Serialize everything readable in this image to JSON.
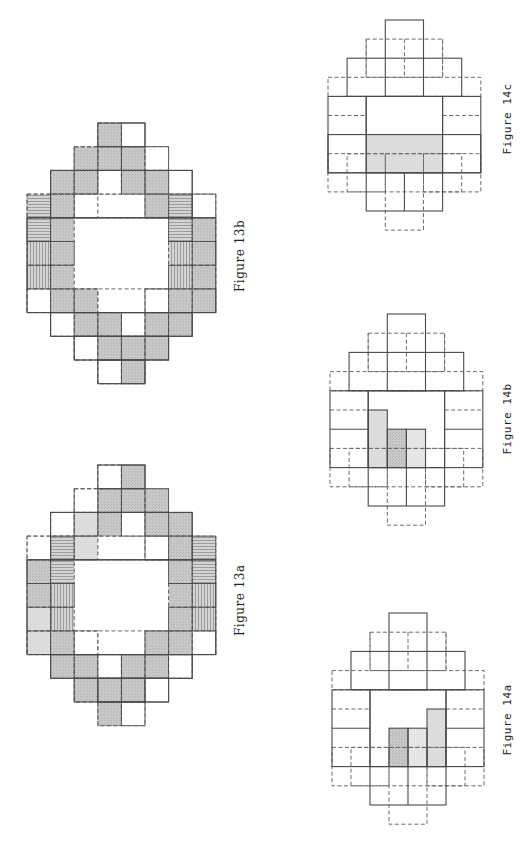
{
  "colors": {
    "line": "#4a4a4a",
    "dashed": "#6a6a6a",
    "shade": "#c9c9c9",
    "shade_dark": "#bdbdbd",
    "shade_light": "#dcdcdc",
    "hatch": "#9a9a9a"
  },
  "figures": [
    {
      "id": "fig-13b",
      "label": "Figure 13b",
      "grid": {
        "cols": 8,
        "rows": 11
      },
      "cells": [
        {
          "r": 0,
          "c": 3,
          "fill": "shade"
        },
        {
          "r": 0,
          "c": 4,
          "fill": "white"
        },
        {
          "r": 1,
          "c": 2,
          "fill": "shade"
        },
        {
          "r": 1,
          "c": 3,
          "fill": "shade"
        },
        {
          "r": 1,
          "c": 4,
          "fill": "shade"
        },
        {
          "r": 1,
          "c": 5,
          "fill": "white"
        },
        {
          "r": 2,
          "c": 1,
          "fill": "shade"
        },
        {
          "r": 2,
          "c": 2,
          "fill": "shade"
        },
        {
          "r": 2,
          "c": 3,
          "fill": "white"
        },
        {
          "r": 2,
          "c": 4,
          "fill": "shade"
        },
        {
          "r": 2,
          "c": 5,
          "fill": "shade"
        },
        {
          "r": 2,
          "c": 6,
          "fill": "white"
        },
        {
          "r": 3,
          "c": 0,
          "fill": "hlines"
        },
        {
          "r": 3,
          "c": 1,
          "fill": "shade"
        },
        {
          "r": 3,
          "c": 2,
          "fill": "white"
        },
        {
          "r": 3,
          "c": 5,
          "fill": "shade"
        },
        {
          "r": 3,
          "c": 6,
          "fill": "hlines"
        },
        {
          "r": 3,
          "c": 7,
          "fill": "white"
        },
        {
          "r": 4,
          "c": 0,
          "fill": "hlines"
        },
        {
          "r": 4,
          "c": 1,
          "fill": "shade"
        },
        {
          "r": 4,
          "c": 6,
          "fill": "hlines"
        },
        {
          "r": 4,
          "c": 7,
          "fill": "shade"
        },
        {
          "r": 5,
          "c": 0,
          "fill": "vlines"
        },
        {
          "r": 5,
          "c": 1,
          "fill": "shade"
        },
        {
          "r": 5,
          "c": 6,
          "fill": "vlines"
        },
        {
          "r": 5,
          "c": 7,
          "fill": "shade"
        },
        {
          "r": 6,
          "c": 0,
          "fill": "vlines"
        },
        {
          "r": 6,
          "c": 1,
          "fill": "shade"
        },
        {
          "r": 6,
          "c": 6,
          "fill": "vlines"
        },
        {
          "r": 6,
          "c": 7,
          "fill": "shade"
        },
        {
          "r": 7,
          "c": 0,
          "fill": "white"
        },
        {
          "r": 7,
          "c": 1,
          "fill": "shade"
        },
        {
          "r": 7,
          "c": 2,
          "fill": "shade"
        },
        {
          "r": 7,
          "c": 5,
          "fill": "white"
        },
        {
          "r": 7,
          "c": 6,
          "fill": "shade"
        },
        {
          "r": 7,
          "c": 7,
          "fill": "shade"
        },
        {
          "r": 8,
          "c": 1,
          "fill": "white"
        },
        {
          "r": 8,
          "c": 2,
          "fill": "shade"
        },
        {
          "r": 8,
          "c": 3,
          "fill": "shade"
        },
        {
          "r": 8,
          "c": 4,
          "fill": "white"
        },
        {
          "r": 8,
          "c": 5,
          "fill": "shade"
        },
        {
          "r": 8,
          "c": 6,
          "fill": "shade"
        },
        {
          "r": 9,
          "c": 2,
          "fill": "white"
        },
        {
          "r": 9,
          "c": 3,
          "fill": "shade"
        },
        {
          "r": 9,
          "c": 4,
          "fill": "shade"
        },
        {
          "r": 9,
          "c": 5,
          "fill": "shade"
        },
        {
          "r": 10,
          "c": 3,
          "fill": "white"
        },
        {
          "r": 10,
          "c": 4,
          "fill": "shade"
        }
      ],
      "solid_rects": [
        [
          3,
          0,
          2,
          1
        ],
        [
          1,
          2,
          6,
          2
        ],
        [
          0,
          4,
          8,
          4
        ],
        [
          1,
          8,
          6,
          1
        ],
        [
          3,
          10,
          2,
          1
        ],
        [
          2,
          9,
          4,
          1
        ]
      ],
      "dashed_rects": [
        [
          2,
          1,
          4,
          1
        ],
        [
          0,
          3,
          8,
          1
        ],
        [
          0,
          7,
          8,
          1
        ],
        [
          1,
          8,
          6,
          1
        ],
        [
          2,
          1,
          1,
          2
        ],
        [
          5,
          2,
          1,
          2
        ],
        [
          2,
          7,
          1,
          1
        ],
        [
          5,
          7,
          1,
          1
        ],
        [
          3,
          10,
          2,
          1
        ],
        [
          2,
          9,
          4,
          1
        ]
      ]
    },
    {
      "id": "fig-13a",
      "label": "Figure 13a",
      "grid": {
        "cols": 8,
        "rows": 11
      },
      "cells": [
        {
          "r": 0,
          "c": 3,
          "fill": "white"
        },
        {
          "r": 0,
          "c": 4,
          "fill": "shade"
        },
        {
          "r": 1,
          "c": 2,
          "fill": "white"
        },
        {
          "r": 1,
          "c": 3,
          "fill": "shade"
        },
        {
          "r": 1,
          "c": 4,
          "fill": "shade"
        },
        {
          "r": 1,
          "c": 5,
          "fill": "shade"
        },
        {
          "r": 2,
          "c": 1,
          "fill": "white"
        },
        {
          "r": 2,
          "c": 2,
          "fill": "light"
        },
        {
          "r": 2,
          "c": 3,
          "fill": "shade"
        },
        {
          "r": 2,
          "c": 4,
          "fill": "white"
        },
        {
          "r": 2,
          "c": 5,
          "fill": "shade"
        },
        {
          "r": 2,
          "c": 6,
          "fill": "shade"
        },
        {
          "r": 3,
          "c": 0,
          "fill": "white"
        },
        {
          "r": 3,
          "c": 1,
          "fill": "hlines"
        },
        {
          "r": 3,
          "c": 2,
          "fill": "light"
        },
        {
          "r": 3,
          "c": 5,
          "fill": "white"
        },
        {
          "r": 3,
          "c": 6,
          "fill": "shade"
        },
        {
          "r": 3,
          "c": 7,
          "fill": "hlines"
        },
        {
          "r": 4,
          "c": 0,
          "fill": "shade"
        },
        {
          "r": 4,
          "c": 1,
          "fill": "hlines"
        },
        {
          "r": 4,
          "c": 6,
          "fill": "shade"
        },
        {
          "r": 4,
          "c": 7,
          "fill": "hlines"
        },
        {
          "r": 5,
          "c": 0,
          "fill": "shade"
        },
        {
          "r": 5,
          "c": 1,
          "fill": "vlines"
        },
        {
          "r": 5,
          "c": 6,
          "fill": "shade"
        },
        {
          "r": 5,
          "c": 7,
          "fill": "vlines"
        },
        {
          "r": 6,
          "c": 0,
          "fill": "light"
        },
        {
          "r": 6,
          "c": 1,
          "fill": "vlines"
        },
        {
          "r": 6,
          "c": 6,
          "fill": "shade"
        },
        {
          "r": 6,
          "c": 7,
          "fill": "vlines"
        },
        {
          "r": 7,
          "c": 0,
          "fill": "light"
        },
        {
          "r": 7,
          "c": 1,
          "fill": "shade"
        },
        {
          "r": 7,
          "c": 2,
          "fill": "white"
        },
        {
          "r": 7,
          "c": 5,
          "fill": "shade"
        },
        {
          "r": 7,
          "c": 6,
          "fill": "shade"
        },
        {
          "r": 7,
          "c": 7,
          "fill": "white"
        },
        {
          "r": 8,
          "c": 1,
          "fill": "shade"
        },
        {
          "r": 8,
          "c": 2,
          "fill": "shade"
        },
        {
          "r": 8,
          "c": 3,
          "fill": "white"
        },
        {
          "r": 8,
          "c": 4,
          "fill": "shade"
        },
        {
          "r": 8,
          "c": 5,
          "fill": "shade"
        },
        {
          "r": 8,
          "c": 6,
          "fill": "white"
        },
        {
          "r": 9,
          "c": 2,
          "fill": "shade"
        },
        {
          "r": 9,
          "c": 3,
          "fill": "shade"
        },
        {
          "r": 9,
          "c": 4,
          "fill": "shade"
        },
        {
          "r": 9,
          "c": 5,
          "fill": "white"
        },
        {
          "r": 10,
          "c": 3,
          "fill": "shade"
        },
        {
          "r": 10,
          "c": 4,
          "fill": "white"
        }
      ],
      "solid_rects": [
        [
          3,
          0,
          2,
          1
        ],
        [
          1,
          2,
          6,
          2
        ],
        [
          0,
          4,
          8,
          4
        ],
        [
          1,
          8,
          6,
          1
        ],
        [
          3,
          9,
          2,
          1
        ],
        [
          2,
          9,
          4,
          1
        ]
      ],
      "dashed_rects": [
        [
          2,
          1,
          4,
          1
        ],
        [
          0,
          3,
          8,
          1
        ],
        [
          0,
          7,
          8,
          1
        ],
        [
          1,
          8,
          6,
          1
        ],
        [
          2,
          1,
          1,
          2
        ],
        [
          5,
          2,
          1,
          2
        ],
        [
          2,
          7,
          1,
          1
        ],
        [
          5,
          7,
          1,
          1
        ],
        [
          3,
          10,
          2,
          1
        ]
      ]
    },
    {
      "id": "fig-14c",
      "label": "Figure 14c",
      "grid": {
        "cols": 8,
        "rows": 11
      },
      "shaded_regions": [
        {
          "c": 2,
          "r": 6,
          "w": 4,
          "h": 2,
          "fill": "light"
        }
      ],
      "solid_rects": [
        [
          3,
          0,
          2,
          4
        ],
        [
          1,
          2,
          6,
          2
        ],
        [
          0,
          4,
          2,
          4
        ],
        [
          6,
          4,
          2,
          4
        ],
        [
          2,
          4,
          4,
          4
        ],
        [
          0,
          6,
          8,
          2
        ],
        [
          2,
          8,
          4,
          2
        ],
        [
          4,
          8,
          0,
          2
        ]
      ],
      "dashed_rects": [
        [
          2,
          1,
          4,
          2
        ],
        [
          4,
          1,
          0,
          2
        ],
        [
          0,
          3,
          8,
          1
        ],
        [
          0,
          5,
          2,
          0
        ],
        [
          6,
          5,
          2,
          0
        ],
        [
          0,
          7,
          3,
          2
        ],
        [
          5,
          7,
          3,
          2
        ],
        [
          1,
          7,
          6,
          2
        ],
        [
          3,
          7,
          2,
          4
        ],
        [
          2,
          1,
          0,
          2
        ],
        [
          6,
          1,
          0,
          2
        ]
      ]
    },
    {
      "id": "fig-14b",
      "label": "Figure 14b",
      "grid": {
        "cols": 8,
        "rows": 11
      },
      "shaded_regions": [
        {
          "c": 2,
          "r": 5,
          "w": 1,
          "h": 3,
          "fill": "light"
        },
        {
          "c": 3,
          "r": 6,
          "w": 1,
          "h": 2,
          "fill": "shade"
        },
        {
          "c": 4,
          "r": 6,
          "w": 1,
          "h": 2,
          "fill": "lighter"
        }
      ],
      "solid_rects": [
        [
          3,
          0,
          2,
          4
        ],
        [
          1,
          2,
          6,
          2
        ],
        [
          0,
          4,
          2,
          4
        ],
        [
          6,
          4,
          2,
          4
        ],
        [
          2,
          4,
          4,
          4
        ],
        [
          0,
          6,
          2,
          0
        ],
        [
          6,
          6,
          2,
          0
        ],
        [
          2,
          5,
          1,
          3
        ],
        [
          3,
          6,
          1,
          2
        ],
        [
          4,
          6,
          1,
          2
        ],
        [
          2,
          8,
          4,
          2
        ],
        [
          4,
          8,
          0,
          2
        ]
      ],
      "dashed_rects": [
        [
          2,
          1,
          4,
          2
        ],
        [
          4,
          1,
          0,
          2
        ],
        [
          0,
          3,
          8,
          1
        ],
        [
          0,
          5,
          2,
          0
        ],
        [
          6,
          5,
          2,
          0
        ],
        [
          0,
          7,
          3,
          2
        ],
        [
          5,
          7,
          3,
          2
        ],
        [
          1,
          7,
          6,
          2
        ],
        [
          3,
          7,
          2,
          4
        ],
        [
          2,
          1,
          0,
          2
        ],
        [
          6,
          1,
          0,
          2
        ]
      ]
    },
    {
      "id": "fig-14a",
      "label": "Figure 14a",
      "grid": {
        "cols": 8,
        "rows": 11
      },
      "shaded_regions": [
        {
          "c": 3,
          "r": 6,
          "w": 1,
          "h": 2,
          "fill": "shade"
        },
        {
          "c": 4,
          "r": 6,
          "w": 1,
          "h": 2,
          "fill": "lighter"
        },
        {
          "c": 5,
          "r": 5,
          "w": 1,
          "h": 3,
          "fill": "light"
        }
      ],
      "solid_rects": [
        [
          3,
          0,
          2,
          4
        ],
        [
          1,
          2,
          6,
          2
        ],
        [
          0,
          4,
          2,
          4
        ],
        [
          6,
          4,
          2,
          4
        ],
        [
          2,
          4,
          4,
          4
        ],
        [
          0,
          6,
          2,
          0
        ],
        [
          6,
          6,
          2,
          0
        ],
        [
          3,
          6,
          1,
          2
        ],
        [
          4,
          6,
          1,
          2
        ],
        [
          5,
          5,
          1,
          3
        ],
        [
          2,
          8,
          4,
          2
        ],
        [
          4,
          8,
          0,
          2
        ]
      ],
      "dashed_rects": [
        [
          2,
          1,
          4,
          2
        ],
        [
          4,
          1,
          0,
          2
        ],
        [
          0,
          3,
          8,
          1
        ],
        [
          0,
          5,
          2,
          0
        ],
        [
          6,
          5,
          2,
          0
        ],
        [
          0,
          7,
          3,
          2
        ],
        [
          5,
          7,
          3,
          2
        ],
        [
          1,
          7,
          6,
          2
        ],
        [
          3,
          7,
          2,
          4
        ],
        [
          2,
          1,
          0,
          2
        ],
        [
          6,
          1,
          0,
          2
        ]
      ]
    }
  ]
}
